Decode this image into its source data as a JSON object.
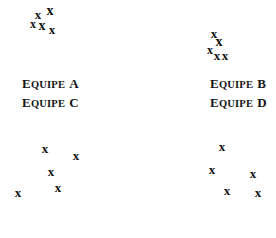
{
  "figure": {
    "width": 276,
    "height": 238,
    "background": "#ffffff",
    "ink_color": "#111111"
  },
  "chart_data": {
    "type": "scatter",
    "title": "",
    "xlabel": "",
    "ylabel": "",
    "grid": false,
    "legend": "none",
    "marker": "x",
    "panels": [
      {
        "id": "a",
        "label_prefix": "E",
        "label_body": "QUIPE",
        "label_suffix": "A",
        "label_full": "EQUIPE A",
        "label_x": 22,
        "label_y": 75,
        "point_count": 5,
        "points": [
          {
            "x": 38,
            "y": 14,
            "size": 13
          },
          {
            "x": 50,
            "y": 11,
            "size": 14
          },
          {
            "x": 33,
            "y": 24,
            "size": 12
          },
          {
            "x": 42,
            "y": 26,
            "size": 14
          },
          {
            "x": 52,
            "y": 29,
            "size": 13
          }
        ]
      },
      {
        "id": "b",
        "label_prefix": "E",
        "label_body": "QUIPE",
        "label_suffix": "B",
        "label_full": "EQUIPE B",
        "label_x": 210,
        "label_y": 75,
        "point_count": 5,
        "points": [
          {
            "x": 76,
            "y": 33,
            "size": 13
          },
          {
            "x": 81,
            "y": 42,
            "size": 14
          },
          {
            "x": 72,
            "y": 50,
            "size": 12
          },
          {
            "x": 79,
            "y": 55,
            "size": 13
          },
          {
            "x": 87,
            "y": 55,
            "size": 13
          }
        ]
      },
      {
        "id": "c",
        "label_prefix": "E",
        "label_body": "QUIPE",
        "label_suffix": "C",
        "label_full": "EQUIPE C",
        "label_x": 22,
        "label_y": 94,
        "point_count": 5,
        "points": [
          {
            "x": 45,
            "y": 29,
            "size": 13
          },
          {
            "x": 76,
            "y": 36,
            "size": 13
          },
          {
            "x": 51,
            "y": 52,
            "size": 13
          },
          {
            "x": 58,
            "y": 68,
            "size": 13
          },
          {
            "x": 18,
            "y": 73,
            "size": 13
          }
        ]
      },
      {
        "id": "d",
        "label_prefix": "E",
        "label_body": "QUIPE",
        "label_suffix": "D",
        "label_full": "EQUIPE D",
        "label_x": 210,
        "label_y": 94,
        "point_count": 5,
        "points": [
          {
            "x": 84,
            "y": 27,
            "size": 13
          },
          {
            "x": 74,
            "y": 50,
            "size": 13
          },
          {
            "x": 115,
            "y": 54,
            "size": 13
          },
          {
            "x": 89,
            "y": 71,
            "size": 13
          },
          {
            "x": 120,
            "y": 73,
            "size": 13
          }
        ]
      }
    ]
  }
}
